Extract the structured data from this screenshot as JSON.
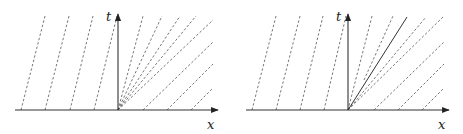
{
  "figures": [
    {
      "id": "left",
      "description": "Characteristic lines in x-t plane with rarefaction fan from origin",
      "axes": {
        "x_label": "x",
        "t_label": "t"
      },
      "origin": [
        118,
        110
      ],
      "x_axis": {
        "from": [
          15,
          110
        ],
        "to": [
          218,
          110
        ]
      },
      "t_axis": {
        "from": [
          118,
          110
        ],
        "to": [
          118,
          14
        ]
      },
      "dashed_lines": [
        {
          "from": [
            21,
            110
          ],
          "to": [
            45,
            16
          ]
        },
        {
          "from": [
            45,
            110
          ],
          "to": [
            69,
            16
          ]
        },
        {
          "from": [
            70,
            110
          ],
          "to": [
            93,
            16
          ]
        },
        {
          "from": [
            94,
            110
          ],
          "to": [
            117,
            16
          ]
        },
        {
          "from": [
            118,
            110
          ],
          "to": [
            143,
            16
          ]
        },
        {
          "from": [
            118,
            110
          ],
          "to": [
            162,
            16
          ]
        },
        {
          "from": [
            118,
            110
          ],
          "to": [
            180,
            16
          ]
        },
        {
          "from": [
            118,
            110
          ],
          "to": [
            196,
            16
          ]
        },
        {
          "from": [
            118,
            110
          ],
          "to": [
            213,
            20
          ]
        },
        {
          "from": [
            143,
            110
          ],
          "to": [
            213,
            42
          ]
        },
        {
          "from": [
            167,
            110
          ],
          "to": [
            213,
            64
          ]
        },
        {
          "from": [
            191,
            110
          ],
          "to": [
            213,
            88
          ]
        }
      ],
      "solid_lines": []
    },
    {
      "id": "right",
      "description": "Characteristic lines in x-t plane with shock line from origin",
      "axes": {
        "x_label": "x",
        "t_label": "t"
      },
      "origin": [
        348,
        110
      ],
      "x_axis": {
        "from": [
          246,
          110
        ],
        "to": [
          449,
          110
        ]
      },
      "t_axis": {
        "from": [
          348,
          110
        ],
        "to": [
          348,
          14
        ]
      },
      "dashed_lines": [
        {
          "from": [
            252,
            110
          ],
          "to": [
            276,
            16
          ]
        },
        {
          "from": [
            276,
            110
          ],
          "to": [
            300,
            16
          ]
        },
        {
          "from": [
            300,
            110
          ],
          "to": [
            323,
            16
          ]
        },
        {
          "from": [
            324,
            110
          ],
          "to": [
            346,
            16
          ]
        },
        {
          "from": [
            348,
            110
          ],
          "to": [
            372,
            16
          ]
        },
        {
          "from": [
            364,
            80
          ],
          "to": [
            393,
            16
          ]
        },
        {
          "from": [
            348,
            110
          ],
          "to": [
            426,
            17
          ]
        },
        {
          "from": [
            348,
            110
          ],
          "to": [
            444,
            16
          ]
        },
        {
          "from": [
            374,
            110
          ],
          "to": [
            444,
            42
          ]
        },
        {
          "from": [
            398,
            110
          ],
          "to": [
            444,
            64
          ]
        },
        {
          "from": [
            422,
            110
          ],
          "to": [
            444,
            88
          ]
        }
      ],
      "solid_lines": [
        {
          "from": [
            348,
            110
          ],
          "to": [
            407,
            17
          ]
        }
      ]
    }
  ],
  "labels": {
    "left_t": {
      "text": "t",
      "pos": [
        106,
        21
      ]
    },
    "left_x": {
      "text": "x",
      "pos": [
        207,
        129
      ]
    },
    "right_t": {
      "text": "t",
      "pos": [
        336,
        21
      ]
    },
    "right_x": {
      "text": "x",
      "pos": [
        438,
        129
      ]
    }
  },
  "colors": {
    "axis": "#333333",
    "dash": "#555555",
    "background": "#ffffff"
  }
}
